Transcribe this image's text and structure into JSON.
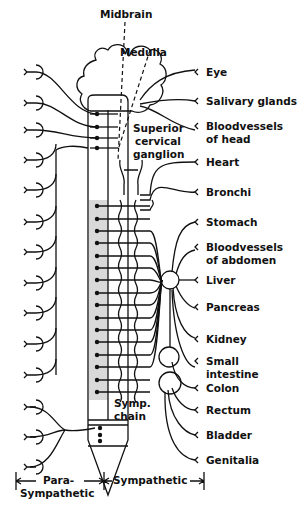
{
  "diagram": {
    "type": "autonomic-nervous-system",
    "labels": {
      "midbrain": "Midbrain",
      "medulla": "Medulla",
      "superior_cervical_ganglion": [
        "Superior",
        "cervical",
        "ganglion"
      ],
      "symp_chain": [
        "Symp.",
        "chain"
      ],
      "parasympathetic": [
        "Para-",
        "Sympathetic"
      ],
      "sympathetic": "Sympathetic"
    },
    "organs": [
      {
        "lines": [
          "Eye"
        ],
        "y": 72
      },
      {
        "lines": [
          "Salivary glands"
        ],
        "y": 101
      },
      {
        "lines": [
          "Bloodvessels",
          "of head"
        ],
        "y": 126
      },
      {
        "lines": [
          "Heart"
        ],
        "y": 162
      },
      {
        "lines": [
          "Bronchi"
        ],
        "y": 192
      },
      {
        "lines": [
          "Stomach"
        ],
        "y": 222
      },
      {
        "lines": [
          "Bloodvessels",
          "of abdomen"
        ],
        "y": 247
      },
      {
        "lines": [
          "Liver"
        ],
        "y": 280
      },
      {
        "lines": [
          "Pancreas"
        ],
        "y": 307
      },
      {
        "lines": [
          "Kidney"
        ],
        "y": 339
      },
      {
        "lines": [
          "Small",
          "intestine"
        ],
        "y": 361
      },
      {
        "lines": [
          "Colon"
        ],
        "y": 388
      },
      {
        "lines": [
          "Rectum"
        ],
        "y": 410
      },
      {
        "lines": [
          "Bladder"
        ],
        "y": 435
      },
      {
        "lines": [
          "Genitalia"
        ],
        "y": 460
      }
    ],
    "left_ganglia_y": [
      72,
      103,
      130,
      160,
      190,
      222,
      252,
      283,
      313,
      344,
      375,
      407,
      437,
      467
    ],
    "spinal_dots_y": [
      206,
      219,
      231,
      243,
      256,
      268,
      280,
      293,
      305,
      318,
      330,
      342,
      355,
      367,
      380,
      392
    ],
    "brainstem_dots_y": [
      114,
      127,
      138,
      148
    ],
    "sacral_dots_y": [
      428,
      435,
      441
    ]
  }
}
